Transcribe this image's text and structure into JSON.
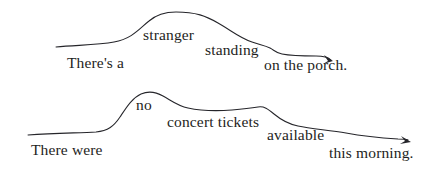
{
  "figure": {
    "type": "intonation-contour-diagram",
    "ink_color": "#25252a",
    "background_color": "#ffffff",
    "utterances": [
      {
        "id": "utterance-1",
        "full_text": "There's a stranger standing on the porch.",
        "words": [
          {
            "text": "There's a",
            "x": 67,
            "baseline_y": 69
          },
          {
            "text": "stranger",
            "x": 143,
            "baseline_y": 41
          },
          {
            "text": "standing",
            "x": 205,
            "baseline_y": 56
          },
          {
            "text": "on the porch.",
            "x": 264,
            "baseline_y": 71
          }
        ],
        "contour": "M 56 47 C 78 45, 98 45, 114 42 C 132 39, 140 28, 149 21 C 157 14, 166 12, 176 12 C 196 12, 206 16, 218 23 C 232 31, 240 38, 252 42 C 260 45, 264 45, 270 48 C 274 50, 276 53, 282 54 C 292 56, 304 56, 316 56 C 324 56, 328 57, 331 60",
        "arrow_tip": {
          "x": 333,
          "y": 61
        }
      },
      {
        "id": "utterance-2",
        "full_text": "There were no concert tickets available this morning.",
        "words": [
          {
            "text": "There were",
            "x": 31,
            "baseline_y": 156
          },
          {
            "text": "no",
            "x": 136,
            "baseline_y": 111
          },
          {
            "text": "concert tickets",
            "x": 167,
            "baseline_y": 128
          },
          {
            "text": "available",
            "x": 267,
            "baseline_y": 141
          },
          {
            "text": "this morning.",
            "x": 329,
            "baseline_y": 159
          }
        ],
        "contour": "M 28 135 C 55 133, 78 133, 96 132 C 108 131, 114 126, 120 117 C 126 108, 132 98, 141 94 C 148 91, 156 92, 163 96 C 172 101, 178 106, 188 108 C 202 111, 218 111, 232 110 C 244 109, 252 108, 258 107 C 264 106, 268 109, 274 114 C 280 119, 288 124, 298 126 C 312 129, 330 130, 346 133 C 362 136, 382 138, 398 139 C 403 139, 406 139, 408 140",
        "arrow_tip": {
          "x": 410,
          "y": 141
        }
      }
    ]
  }
}
